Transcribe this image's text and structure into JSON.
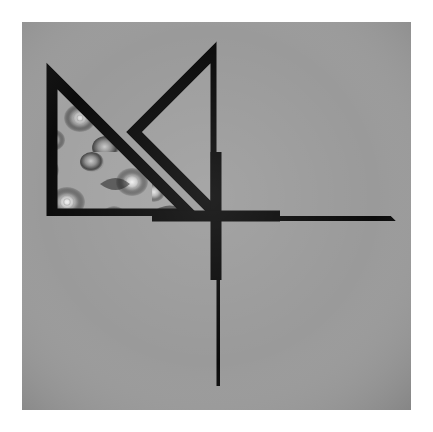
{
  "image": {
    "kind": "photograph",
    "subject": "patchwork quilt block",
    "pattern_name": "pinwheel",
    "color_mode": "grayscale",
    "canvas": {
      "width": 433,
      "height": 432,
      "background": "#ffffff"
    },
    "block": {
      "left": 22,
      "top": 22,
      "width": 389,
      "height": 388
    }
  },
  "palette": {
    "page_background": "#ffffff",
    "background_fabric_base": "#7e7e7e",
    "background_fabric_marks": "#5a5a5a",
    "background_fabric_highlight": "#9a9a9a",
    "solid_fabric_base": "#6f6f6f",
    "solid_fabric_light": "#7d7d7d",
    "solid_fabric_dark": "#606060",
    "floral_fabric_base": "#1e1e1e",
    "floral_fabric_mid": "#8a8a8a",
    "floral_fabric_light": "#d8d8d8",
    "seam_line": "#0a0a0a"
  },
  "geometry": {
    "center": {
      "x": 194,
      "y": 192
    },
    "seam_stroke_width": 11,
    "quadrants": [
      {
        "name": "top-left",
        "rotation_deg": 0
      },
      {
        "name": "top-right",
        "rotation_deg": 90
      },
      {
        "name": "bottom-right",
        "rotation_deg": 180
      },
      {
        "name": "bottom-left",
        "rotation_deg": 270
      }
    ]
  },
  "fabrics": [
    {
      "id": "background",
      "label": "textured gray background fabric",
      "tone": "medium gray",
      "motif": "scratchy brush marks"
    },
    {
      "id": "floral",
      "label": "dark floral print fabric",
      "tone": "dark with light blooms",
      "motif": "roses and mixed flowers"
    },
    {
      "id": "solid",
      "label": "mottled solid gray fabric",
      "tone": "medium-dark gray",
      "motif": "subtle cloudy mottling"
    }
  ],
  "patches": [
    {
      "quadrant": "top-left",
      "shape": "half-square-triangle",
      "fabric": "floral",
      "orientation": "right angle at lower-left"
    },
    {
      "quadrant": "top-left",
      "shape": "half-square-triangle",
      "fabric": "solid",
      "orientation": "apex pointing left"
    },
    {
      "quadrant": "top-right",
      "shape": "half-square-triangle",
      "fabric": "floral",
      "orientation": "right angle at upper-left"
    },
    {
      "quadrant": "top-right",
      "shape": "half-square-triangle",
      "fabric": "solid",
      "orientation": "apex pointing up"
    },
    {
      "quadrant": "bottom-right",
      "shape": "half-square-triangle",
      "fabric": "floral",
      "orientation": "right angle at upper-right"
    },
    {
      "quadrant": "bottom-right",
      "shape": "half-square-triangle",
      "fabric": "solid",
      "orientation": "apex pointing right"
    },
    {
      "quadrant": "bottom-left",
      "shape": "half-square-triangle",
      "fabric": "floral",
      "orientation": "right angle at lower-right"
    },
    {
      "quadrant": "bottom-left",
      "shape": "half-square-triangle",
      "fabric": "solid",
      "orientation": "apex pointing down"
    }
  ],
  "text": {
    "caption": "",
    "labels": []
  }
}
